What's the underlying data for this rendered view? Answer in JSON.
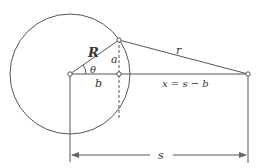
{
  "diagram": {
    "type": "geometry",
    "labels": {
      "radius": "R",
      "angle": "θ",
      "height": "a",
      "base": "b",
      "distance_r": "r",
      "x_expr": "x = s − b",
      "s": "s"
    },
    "geometry": {
      "circle_center": [
        70,
        74
      ],
      "circle_radius": 60,
      "point_on_circle": [
        119,
        40
      ],
      "foot_point": [
        119,
        74
      ],
      "external_point": [
        248,
        74
      ],
      "dimension_y": 155
    },
    "colors": {
      "stroke": "#555555",
      "text": "#333333",
      "background": "#ffffff"
    }
  }
}
